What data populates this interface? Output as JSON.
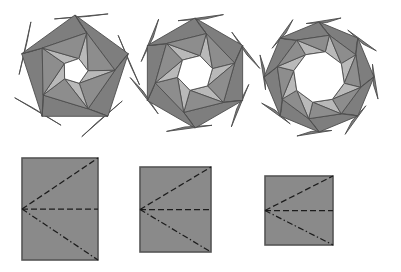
{
  "figure": {
    "background_color": "#ffffff",
    "stroke_color": "#4d4d4d",
    "stroke_width": 0.9,
    "palette": {
      "dark_gray": "#7e7e7e",
      "mid_gray": "#8d8d8d",
      "light_gray": "#b9b9b9",
      "pale_gray": "#d2d2d2",
      "white": "#ffffff",
      "sheet_fill": "#8a8a8a",
      "sheet_edge": "#565656",
      "crease_color": "#1c1c1c"
    }
  },
  "rosettes": [
    {
      "name": "pentagonal-rosette",
      "label": "5-fold rosette",
      "sides": 5,
      "center": {
        "x": 75,
        "y": 71
      },
      "outer_radius": 56,
      "core_radius": 13,
      "ring_radius": 40,
      "spike_radius": 66,
      "rotation": -90,
      "twist": 17,
      "core_fill": "#ffffff",
      "petal_fills": [
        "#7e7e7e",
        "#b9b9b9",
        "#8d8d8d",
        "#d2d2d2"
      ]
    },
    {
      "name": "hexagonal-rosette",
      "label": "6-fold rosette",
      "sides": 6,
      "center": {
        "x": 195,
        "y": 73
      },
      "outer_radius": 55,
      "core_radius": 18,
      "ring_radius": 41,
      "spike_radius": 65,
      "rotation": -90,
      "twist": 16,
      "core_fill": "#ffffff",
      "petal_fills": [
        "#7e7e7e",
        "#b9b9b9",
        "#8d8d8d",
        "#d2d2d2"
      ]
    },
    {
      "name": "octagonal-rosette",
      "label": "8-fold rosette",
      "sides": 8,
      "center": {
        "x": 319,
        "y": 77
      },
      "outer_radius": 55,
      "core_radius": 26,
      "ring_radius": 43,
      "spike_radius": 63,
      "rotation": -90,
      "twist": 14,
      "core_fill": "#ffffff",
      "petal_fills": [
        "#7e7e7e",
        "#b9b9b9",
        "#8d8d8d",
        "#d2d2d2"
      ]
    }
  ],
  "sheets": [
    {
      "name": "sheet-tall-rectangle",
      "label": "tall rectangle crease pattern",
      "x": 22,
      "y": 158,
      "width": 76,
      "height": 102,
      "fill": "#8a8a8a",
      "edge": "#565656",
      "creases": [
        {
          "name": "crease-upper-diagonal",
          "style": "dashed",
          "from": "left-mid",
          "to": "top-right"
        },
        {
          "name": "crease-horizontal-midline",
          "style": "dashed",
          "from": "left-mid",
          "to": "right-mid"
        },
        {
          "name": "crease-lower-diagonal",
          "style": "dash-dot",
          "from": "left-mid",
          "to": "bottom-right"
        }
      ]
    },
    {
      "name": "sheet-near-square",
      "label": "near-square crease pattern",
      "x": 140,
      "y": 167,
      "width": 71,
      "height": 85,
      "fill": "#8a8a8a",
      "edge": "#565656",
      "creases": [
        {
          "name": "crease-upper-diagonal",
          "style": "dashed",
          "from": "left-mid",
          "to": "top-right"
        },
        {
          "name": "crease-horizontal-midline",
          "style": "dashed",
          "from": "left-mid",
          "to": "right-mid"
        },
        {
          "name": "crease-lower-diagonal",
          "style": "dash-dot",
          "from": "left-mid",
          "to": "bottom-right"
        }
      ]
    },
    {
      "name": "sheet-wide-rectangle",
      "label": "wide rectangle crease pattern",
      "x": 265,
      "y": 176,
      "width": 68,
      "height": 69,
      "fill": "#8a8a8a",
      "edge": "#565656",
      "creases": [
        {
          "name": "crease-upper-diagonal",
          "style": "dashed",
          "from": "left-mid",
          "to": "top-right"
        },
        {
          "name": "crease-horizontal-midline",
          "style": "dashed",
          "from": "left-mid",
          "to": "right-mid"
        },
        {
          "name": "crease-lower-diagonal",
          "style": "dash-dot",
          "from": "left-mid",
          "to": "bottom-right"
        }
      ]
    }
  ]
}
